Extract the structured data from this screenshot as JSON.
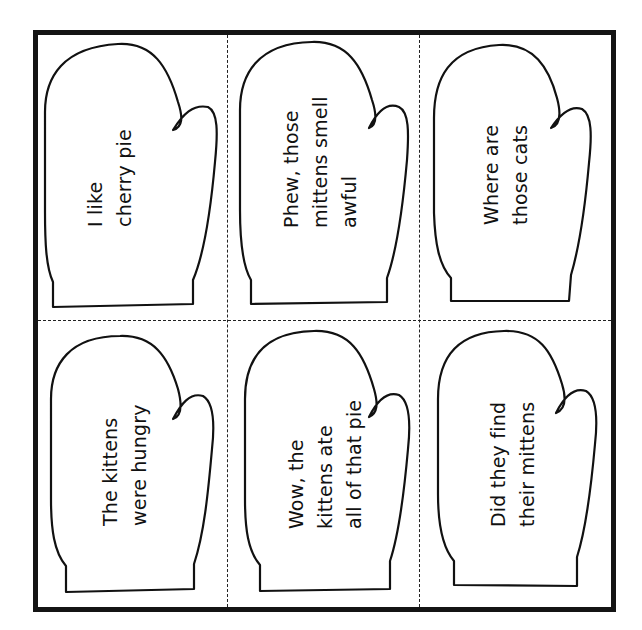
{
  "sheet": {
    "border_color": "#141414",
    "cut_line_style": "dashed",
    "layout": {
      "rows": 2,
      "columns": 3
    }
  },
  "mittens": [
    {
      "row": 0,
      "col": 0,
      "lines": [
        "I like",
        "cherry pie"
      ],
      "text": "I like\ncherry pie"
    },
    {
      "row": 0,
      "col": 1,
      "lines": [
        "Phew, those",
        "mittens smell",
        "awful"
      ],
      "text": "Phew, those\nmittens smell\nawful"
    },
    {
      "row": 0,
      "col": 2,
      "lines": [
        "Where are",
        "those cats"
      ],
      "text": "Where are\nthose cats"
    },
    {
      "row": 1,
      "col": 0,
      "lines": [
        "The kittens",
        "were hungry"
      ],
      "text": "The kittens\nwere hungry"
    },
    {
      "row": 1,
      "col": 1,
      "lines": [
        "Wow, the",
        "kittens ate",
        "all of that pie"
      ],
      "text": "Wow, the\nkittens ate\nall of that pie"
    },
    {
      "row": 1,
      "col": 2,
      "lines": [
        "Did they find",
        "their mittens"
      ],
      "text": "Did they find\ntheir mittens"
    }
  ]
}
